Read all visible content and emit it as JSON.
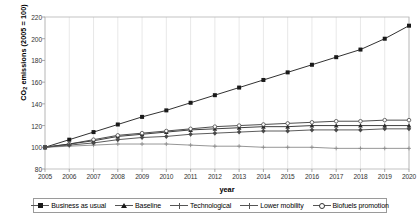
{
  "chart_data": {
    "type": "line",
    "title": "",
    "xlabel": "year",
    "ylabel": "CO2 emissions (2005 = 100)",
    "ylabel_prefix": "CO",
    "ylabel_sub": "2",
    "ylabel_suffix": " emissions (2005 = 100)",
    "ylim": [
      80,
      220
    ],
    "yticks": [
      80,
      100,
      120,
      140,
      160,
      180,
      200,
      220
    ],
    "x": [
      2005,
      2006,
      2007,
      2008,
      2009,
      2010,
      2011,
      2012,
      2013,
      2014,
      2015,
      2016,
      2017,
      2018,
      2019,
      2020
    ],
    "xticks": [
      "2005",
      "2006",
      "2007",
      "2008",
      "2009",
      "2010",
      "2011",
      "2012",
      "2013",
      "2014",
      "2015",
      "2016",
      "2017",
      "2018",
      "2019",
      "2020"
    ],
    "grid": "vertical",
    "legend_position": "bottom",
    "series": [
      {
        "name": "Business as usual",
        "marker": "sq",
        "color": "#1a1a1a",
        "values": [
          100,
          107,
          114,
          121,
          128,
          134,
          141,
          148,
          155,
          162,
          169,
          176,
          183,
          190,
          200,
          212
        ]
      },
      {
        "name": "Baseline",
        "marker": "tri",
        "color": "#2b2b2b",
        "values": [
          100,
          103,
          106,
          110,
          112,
          114,
          116,
          117,
          118,
          119,
          119,
          120,
          120,
          120,
          120,
          120
        ]
      },
      {
        "name": "Technological",
        "marker": "circ",
        "color": "#3a3a3a",
        "values": [
          100,
          103,
          107,
          111,
          113,
          115,
          117,
          119,
          120,
          121,
          122,
          123,
          124,
          124,
          125,
          125
        ]
      },
      {
        "name": "Lower mobility",
        "marker": "cross",
        "color": "#8a8a8a",
        "values": [
          100,
          101,
          102,
          103,
          103,
          103,
          102,
          101,
          101,
          100,
          100,
          100,
          99,
          99,
          99,
          99
        ]
      },
      {
        "name": "Biofuels promotion",
        "marker": "dia",
        "color": "#4a4a4a",
        "values": [
          100,
          102,
          104,
          107,
          109,
          110,
          112,
          113,
          114,
          115,
          115,
          116,
          116,
          116,
          117,
          117
        ]
      }
    ]
  },
  "legend": {
    "items": [
      {
        "label": "Business as usual",
        "marker": "sq"
      },
      {
        "label": "Baseline",
        "marker": "tri"
      },
      {
        "label": "Technological",
        "marker": "cross"
      },
      {
        "label": "Lower mobility",
        "marker": "cross"
      },
      {
        "label": "Biofuels promotion",
        "marker": "circ"
      }
    ]
  }
}
